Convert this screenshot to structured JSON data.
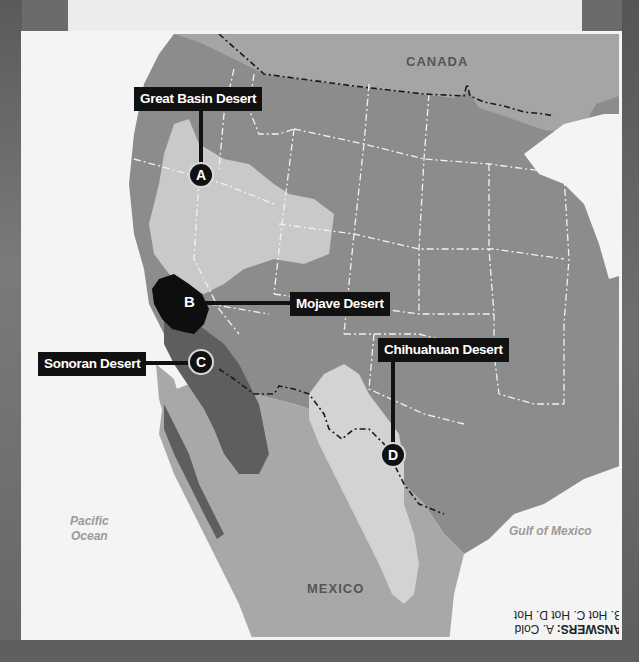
{
  "map": {
    "countries": {
      "canada": "CANADA",
      "mexico": "MEXICO"
    },
    "water_bodies": {
      "pacific_line1": "Pacific",
      "pacific_line2": "Ocean",
      "gulf": "Gulf of Mexico"
    },
    "deserts": [
      {
        "name": "Great Basin Desert",
        "marker": "A"
      },
      {
        "name": "Mojave Desert",
        "marker": "B"
      },
      {
        "name": "Sonoran Desert",
        "marker": "C"
      },
      {
        "name": "Chihuahuan Desert",
        "marker": "D"
      }
    ],
    "answers": {
      "heading": "ANSWERS:",
      "line1_rest": " A. Cold",
      "line2": "B. Hot C. Hot D. Hot"
    },
    "colors": {
      "ocean": "#f4f4f4",
      "land": "#8c8c8c",
      "canada": "#a5a5a5",
      "great_basin": "#c9c9c9",
      "mojave": "#0e0e0e",
      "sonoran": "#5e5e5e",
      "chihuahuan": "#d3d3d3",
      "mexico_land": "#a8a8a8",
      "label_bg": "#111111"
    }
  }
}
